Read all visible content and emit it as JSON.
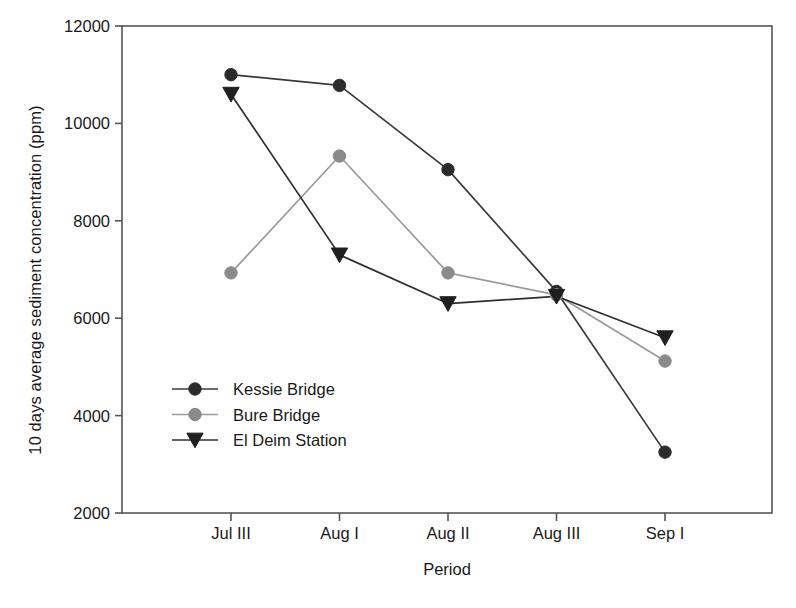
{
  "chart_data": {
    "type": "line",
    "title": "",
    "xlabel": "Period",
    "ylabel": "10 days average sediment concentration (ppm)",
    "categories": [
      "Jul III",
      "Aug I",
      "Aug II",
      "Aug III",
      "Sep I"
    ],
    "ylim": [
      2000,
      12000
    ],
    "yticks": [
      2000,
      4000,
      6000,
      8000,
      10000,
      12000
    ],
    "ytick_labels": [
      "2000",
      "4000",
      "6000",
      "8000",
      "10000",
      "12000"
    ],
    "grid": false,
    "legend_position": "inside-lower-left",
    "series": [
      {
        "name": "Kessie Bridge",
        "marker": "circle",
        "color": "#2b2b2b",
        "line_color": "#3a3a3a",
        "values": [
          11000,
          10780,
          9050,
          6550,
          3250
        ]
      },
      {
        "name": "Bure Bridge",
        "marker": "circle",
        "color": "#8a8a8a",
        "line_color": "#9a9a9a",
        "values": [
          6930,
          9330,
          6930,
          6480,
          5120
        ]
      },
      {
        "name": "El Deim Station",
        "marker": "triangle-down",
        "color": "#1f1f1f",
        "line_color": "#2e2e2e",
        "values": [
          10600,
          7300,
          6300,
          6450,
          5600
        ]
      }
    ]
  },
  "axes": {
    "frame_color": "#555555",
    "tick_color": "#555555"
  }
}
